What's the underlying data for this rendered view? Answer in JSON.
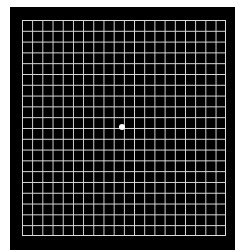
{
  "figure": {
    "type": "amsler-grid",
    "rows": 20,
    "columns": 20,
    "background_color": "#000000",
    "line_color": "#dddddd",
    "center_dot_color": "#ffffff"
  }
}
